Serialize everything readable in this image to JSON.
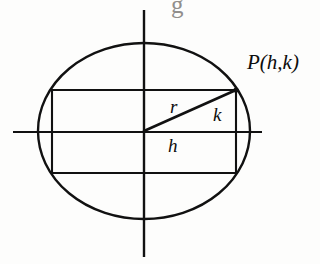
{
  "figure": {
    "background_color": "#fdfdfc",
    "stroke_color": "#111111",
    "labels": {
      "point_p": "P(h,k)",
      "radius": "r",
      "vertical_leg": "k",
      "horizontal_leg": "h"
    },
    "artifacts": {
      "top_text": "",
      "bottom_text": "",
      "top_glyph": "g"
    },
    "geometry": {
      "center_x": 144,
      "center_y": 131,
      "ellipse_rx": 106,
      "ellipse_ry": 88,
      "rect_left": 52,
      "rect_right": 236,
      "rect_top": 90,
      "rect_bottom": 173,
      "point_p_x": 236,
      "point_p_y": 90,
      "x_axis_y": 132,
      "x_axis_start": 13,
      "x_axis_end": 262,
      "y_axis_x": 144,
      "y_axis_start": 10,
      "y_axis_end": 257
    }
  }
}
